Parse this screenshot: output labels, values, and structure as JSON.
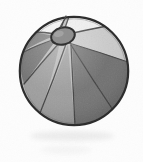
{
  "image": {
    "title": "Beach ball",
    "subject": "beach-ball",
    "alt_text": "Grayscale line drawing of a beach ball with eight alternating light and dark panels and a small oval cap near the top",
    "style": "grayscale scanned clip-art illustration",
    "width": 143,
    "height": 162
  },
  "canvas": {
    "background_color": "#fdfdfd",
    "paper_tint_color": "#f6f6f6"
  },
  "ball": {
    "center_x": 74,
    "center_y": 71,
    "radius": 55,
    "outline_color": "#2b2b2b",
    "outline_width": 2.2,
    "panel_seam_color": "#3a3a3a",
    "panel_seam_width": 1.3,
    "panel_count": 8,
    "panels": [
      {
        "id": "panel-1",
        "name": "upper-left-highlight",
        "tone": "highlight",
        "color": "#f3f3f3"
      },
      {
        "id": "panel-2",
        "name": "upper-left-dark",
        "tone": "dark",
        "color": "#777777"
      },
      {
        "id": "panel-3",
        "name": "left-dark",
        "tone": "dark",
        "color": "#6e6e6e"
      },
      {
        "id": "panel-4",
        "name": "lower-left-mid",
        "tone": "mid",
        "color": "#9b9b9b"
      },
      {
        "id": "panel-5",
        "name": "bottom-center-mid",
        "tone": "mid",
        "color": "#9a9a9a"
      },
      {
        "id": "panel-6",
        "name": "lower-right-dark",
        "tone": "dark",
        "color": "#707070"
      },
      {
        "id": "panel-7",
        "name": "right-dark",
        "tone": "dark",
        "color": "#6b6b6b"
      },
      {
        "id": "panel-8",
        "name": "upper-right-light",
        "tone": "light",
        "color": "#c9c9c9"
      },
      {
        "id": "panel-9",
        "name": "top-right-highlight",
        "tone": "highlight",
        "color": "#efefef"
      }
    ]
  },
  "cap": {
    "name": "valve-cap",
    "center_x": 63,
    "center_y": 36,
    "radius_x": 12,
    "radius_y": 8.5,
    "rotation_deg": -14,
    "fill_color": "#8e8e8e",
    "outline_color": "#2f2f2f",
    "outline_width": 2
  },
  "seam_line": {
    "name": "top-short-seam",
    "color": "#4a4a4a",
    "description": "short curved seam above the cap"
  },
  "shadow": {
    "name": "ground-shadow",
    "color": "#e9e9e9",
    "center_x": 72,
    "center_y": 136,
    "radius_x": 42,
    "radius_y": 5
  }
}
